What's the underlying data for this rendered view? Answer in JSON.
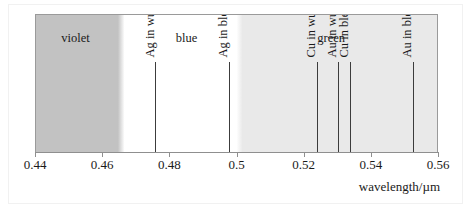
{
  "figure": {
    "kind": "spectrum-band-diagram",
    "axis_title": "wavelength/µm"
  },
  "chart_data": {
    "type": "bar",
    "title": "",
    "subtitle": "",
    "xlabel": "wavelength/µm",
    "ylabel": "",
    "xlim": [
      0.44,
      0.56
    ],
    "grid": false,
    "legend": "none",
    "orientation": "horizontal-spectrum",
    "xticks": [
      0.44,
      0.46,
      0.48,
      0.5,
      0.52,
      0.54,
      0.56
    ],
    "xticklabels": [
      "0.44",
      "0.46",
      "0.48",
      "0.5",
      "0.52",
      "0.54",
      "0.56"
    ],
    "regions": [
      {
        "label": "violet",
        "start": 0.44,
        "end": 0.4645,
        "fade_end": 0.4665,
        "label_at": 0.4518,
        "color": "#c2c2c2"
      },
      {
        "label": "blue",
        "start": 0.4665,
        "end": 0.5,
        "fade_end": 0.5018,
        "label_at": 0.4848,
        "color": "#ffffff"
      },
      {
        "label": "green",
        "start": 0.5018,
        "end": 0.56,
        "fade_end": 0.56,
        "label_at": 0.5279,
        "color": "#e9e9e9"
      }
    ],
    "categories": [
      "Ag in wurtzite",
      "Ag in blende",
      "Cu in wurtzite",
      "Au in wurtzite",
      "Cu in blende",
      "Au in blende"
    ],
    "values": [
      0.4757,
      0.4975,
      0.5237,
      0.53,
      0.5335,
      0.5523
    ],
    "markers": [
      {
        "label": "Ag in wurtzite",
        "wavelength": 0.4757,
        "line_height": 90
      },
      {
        "label": "Ag in blende",
        "wavelength": 0.4975,
        "line_height": 90
      },
      {
        "label": "Cu in wurtzite",
        "wavelength": 0.5237,
        "line_height": 90
      },
      {
        "label": "Au in wurtzite",
        "wavelength": 0.53,
        "line_height": 90
      },
      {
        "label": "Cu in blende",
        "wavelength": 0.5335,
        "line_height": 90
      },
      {
        "label": "Au in blende",
        "wavelength": 0.5523,
        "line_height": 90
      }
    ]
  }
}
